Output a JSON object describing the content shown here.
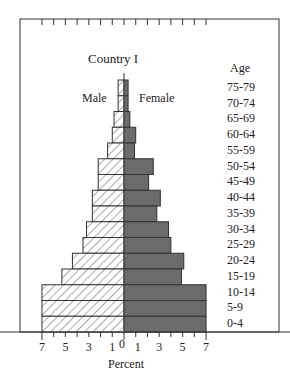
{
  "chart_data": {
    "type": "bar",
    "subtype": "population-pyramid",
    "title": "Country I",
    "xlabel": "Percent",
    "ylabel": "Age",
    "left_series_label": "Male",
    "right_series_label": "Female",
    "xlim": [
      -7,
      7
    ],
    "x_ticks_labeled": [
      "7",
      "5",
      "3",
      "1",
      "0",
      "1",
      "3",
      "5",
      "7"
    ],
    "grid": false,
    "categories": [
      "75-79",
      "70-74",
      "65-69",
      "60-64",
      "55-59",
      "50-54",
      "45-49",
      "40-44",
      "35-39",
      "30-34",
      "25-29",
      "20-24",
      "15-19",
      "10-14",
      "5-9",
      "0-4"
    ],
    "series": [
      {
        "name": "Male",
        "pattern": "hatched",
        "values": [
          0.5,
          0.5,
          0.85,
          1.0,
          1.4,
          2.2,
          2.2,
          2.7,
          2.7,
          3.2,
          3.5,
          4.4,
          5.3,
          7.0,
          7.0,
          7.0
        ]
      },
      {
        "name": "Female",
        "fill": "#6b6b6b",
        "values": [
          0.35,
          0.35,
          0.5,
          1.0,
          0.9,
          2.5,
          2.1,
          3.1,
          2.8,
          3.8,
          4.0,
          5.1,
          4.9,
          7.0,
          7.0,
          7.0
        ]
      }
    ]
  },
  "labels": {
    "title": "Country I",
    "male": "Male",
    "female": "Female",
    "age": "Age",
    "xlabel": "Percent"
  }
}
